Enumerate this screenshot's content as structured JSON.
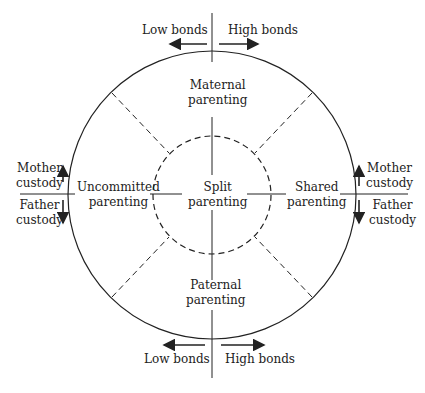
{
  "diagram": {
    "top": {
      "low": "Low bonds",
      "high": "High bonds"
    },
    "bottom": {
      "low": "Low bonds",
      "high": "High bonds"
    },
    "left": {
      "mother": [
        "Mother",
        "custody"
      ],
      "father": [
        "Father",
        "custody"
      ]
    },
    "right": {
      "mother": [
        "Mother",
        "custody"
      ],
      "father": [
        "Father",
        "custody"
      ]
    },
    "sectors": {
      "maternal": [
        "Maternal",
        "parenting"
      ],
      "paternal": [
        "Paternal",
        "parenting"
      ],
      "uncommitted": [
        "Uncommitted",
        "parenting"
      ],
      "shared": [
        "Shared",
        "parenting"
      ],
      "split": [
        "Split",
        "parenting"
      ]
    },
    "colors": {
      "line": "#222222",
      "background": "#ffffff"
    }
  }
}
